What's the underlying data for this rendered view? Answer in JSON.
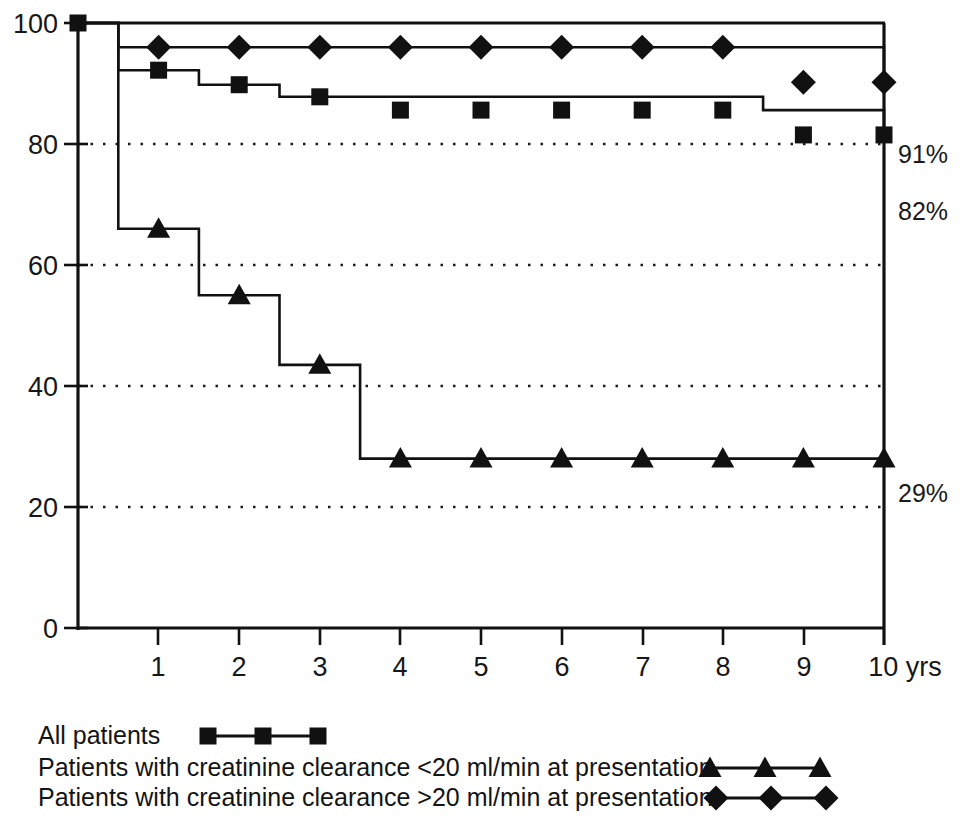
{
  "chart_data": {
    "type": "line",
    "subtype": "kaplan-meier-step",
    "title": "",
    "xlabel": "",
    "ylabel": "",
    "xlim": [
      0,
      10
    ],
    "ylim": [
      0,
      100
    ],
    "x_axis_unit": "10 yrs",
    "xticks": [
      0,
      1,
      2,
      3,
      4,
      5,
      6,
      7,
      8,
      9,
      10
    ],
    "xtick_labels": [
      "0",
      "1",
      "2",
      "3",
      "4",
      "5",
      "6",
      "7",
      "8",
      "9",
      "10 yrs"
    ],
    "yticks": [
      0,
      20,
      40,
      60,
      80,
      100
    ],
    "ytick_labels": [
      "0",
      "20",
      "40",
      "60",
      "80",
      "100"
    ],
    "grid": "horizontal-dotted",
    "grid_values": [
      20,
      40,
      60,
      80
    ],
    "legend_position": "below-plot",
    "series": [
      {
        "name": "All patients",
        "marker": "square",
        "end_label": "82%",
        "step_x": [
          0,
          0.5,
          1.5,
          2.5,
          8.5,
          10
        ],
        "step_y": [
          100,
          92.2,
          89.8,
          87.8,
          85.6,
          81.5
        ],
        "markers": [
          {
            "x": 0,
            "y": 100
          },
          {
            "x": 1,
            "y": 92.2
          },
          {
            "x": 2,
            "y": 89.8
          },
          {
            "x": 3,
            "y": 87.8
          },
          {
            "x": 4,
            "y": 85.6
          },
          {
            "x": 5,
            "y": 85.6
          },
          {
            "x": 6,
            "y": 85.6
          },
          {
            "x": 7,
            "y": 85.6
          },
          {
            "x": 8,
            "y": 85.6
          },
          {
            "x": 9,
            "y": 81.5
          },
          {
            "x": 10,
            "y": 81.5
          }
        ]
      },
      {
        "name": "Patients with creatinine clearance <20 ml/min at presentation",
        "marker": "triangle",
        "end_label": "29%",
        "step_x": [
          0,
          0.5,
          1.5,
          2.5,
          3.5,
          10
        ],
        "step_y": [
          100,
          66.0,
          55.0,
          43.5,
          28.0,
          28.0
        ],
        "markers": [
          {
            "x": 1,
            "y": 66.0
          },
          {
            "x": 2,
            "y": 55.0
          },
          {
            "x": 3,
            "y": 43.5
          },
          {
            "x": 4,
            "y": 28.0
          },
          {
            "x": 5,
            "y": 28.0
          },
          {
            "x": 6,
            "y": 28.0
          },
          {
            "x": 7,
            "y": 28.0
          },
          {
            "x": 8,
            "y": 28.0
          },
          {
            "x": 9,
            "y": 28.0
          },
          {
            "x": 10,
            "y": 28.0
          }
        ]
      },
      {
        "name": "Patients with creatinine clearance >20 ml/min at presentation",
        "marker": "diamond",
        "end_label": "91%",
        "step_x": [
          0,
          0.5,
          8.5,
          10
        ],
        "step_y": [
          100,
          96.0,
          96.0,
          90.2
        ],
        "markers": [
          {
            "x": 1,
            "y": 96.0
          },
          {
            "x": 2,
            "y": 96.0
          },
          {
            "x": 3,
            "y": 96.0
          },
          {
            "x": 4,
            "y": 96.0
          },
          {
            "x": 5,
            "y": 96.0
          },
          {
            "x": 6,
            "y": 96.0
          },
          {
            "x": 7,
            "y": 96.0
          },
          {
            "x": 8,
            "y": 96.0
          },
          {
            "x": 9,
            "y": 90.2
          },
          {
            "x": 10,
            "y": 90.2
          }
        ]
      }
    ],
    "annotations": [
      {
        "text": "91%",
        "value": 91,
        "position": "right-of-plot"
      },
      {
        "text": "82%",
        "value": 82,
        "position": "right-of-plot"
      },
      {
        "text": "29%",
        "value": 29,
        "position": "right-of-plot"
      }
    ]
  },
  "axis": {
    "y_labels": [
      "100",
      "80",
      "60",
      "40",
      "20",
      "0"
    ],
    "x_labels": [
      "1",
      "2",
      "3",
      "4",
      "5",
      "6",
      "7",
      "8",
      "9",
      "10 yrs"
    ]
  },
  "annotations": {
    "pct_high": "91%",
    "pct_all": "82%",
    "pct_low": "29%"
  },
  "legend": {
    "items": [
      {
        "label": "All patients",
        "marker": "square"
      },
      {
        "label": "Patients with creatinine clearance <20 ml/min at presentation",
        "marker": "triangle"
      },
      {
        "label": "Patients with creatinine clearance >20 ml/min at presentation",
        "marker": "diamond"
      }
    ]
  },
  "colors": {
    "ink": "#111111",
    "background": "#ffffff"
  }
}
